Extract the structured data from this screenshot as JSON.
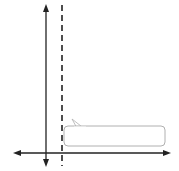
{
  "chart_data": {
    "type": "line",
    "title": "",
    "xlabel": "x",
    "ylabel": "y",
    "xlim": [
      -2,
      8
    ],
    "ylim": [
      0,
      9.5
    ],
    "grid": true,
    "x_ticks": [
      "−1",
      "2",
      "3",
      "4",
      "5",
      "6",
      "7"
    ],
    "y_ticks": [
      "1",
      "2",
      "3",
      "4",
      "5"
    ],
    "series": [
      {
        "name": "y = 3x² − 6x + 5",
        "equation": "y = 3x^2 - 6x + 5",
        "style": "solid",
        "points": [
          {
            "x": -0.2,
            "y": 6.32
          },
          {
            "x": 0,
            "y": 5
          },
          {
            "x": 0.5,
            "y": 2.75
          },
          {
            "x": 1,
            "y": 2
          },
          {
            "x": 1.5,
            "y": 2.75
          },
          {
            "x": 2,
            "y": 5
          },
          {
            "x": 2.2,
            "y": 6.32
          }
        ],
        "marked_points": [
          {
            "x": 0,
            "y": 5
          },
          {
            "x": 1,
            "y": 2
          },
          {
            "x": 2,
            "y": 5
          }
        ]
      }
    ],
    "axis_of_symmetry": {
      "x": 1,
      "style": "dashed"
    },
    "vertex": {
      "x": 1,
      "y": 2
    },
    "annotation": {
      "label_parts": {
        "y": "y",
        "eq": " = 3",
        "x1": "x",
        "sup": "2",
        "mid": " − 6",
        "x2": "x",
        "end": " + 5"
      }
    }
  },
  "colors": {
    "grid": "#c8c8c8",
    "axis": "#222222",
    "curve": "#6b6b6b",
    "dashed": "#222222",
    "label_border": "#b0b0b0"
  }
}
